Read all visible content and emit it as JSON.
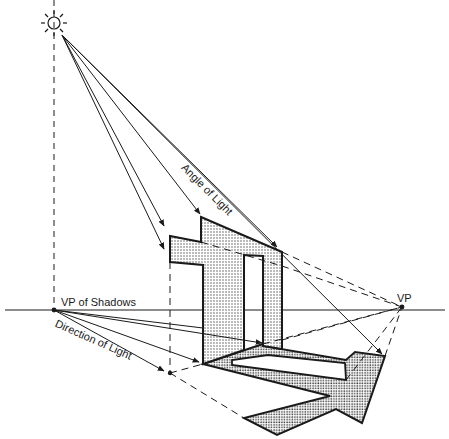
{
  "diagram": {
    "labels": {
      "angle_of_light": "Angle of Light",
      "vp_of_shadows": "VP of Shadows",
      "direction_of_light": "Direction of Light",
      "vp": "VP"
    },
    "elements": {
      "light_source": "sun-icon",
      "horizon_line": "horizon",
      "object": "T-shaped vertical plane with rectangular opening",
      "shadow": "cast shadow on ground plane"
    },
    "colors": {
      "line": "#1a1a1a",
      "fill_pattern_dot": "#555555",
      "background": "#ffffff"
    }
  }
}
